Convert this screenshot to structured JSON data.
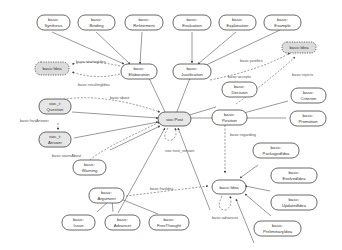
{
  "diagram": {
    "type": "ontology-graph",
    "nodes": {
      "synthesis": {
        "line1": "basic:",
        "line2": "Synthesis"
      },
      "binding": {
        "line1": "basic:",
        "line2": "Binding"
      },
      "refinement": {
        "line1": "basic:",
        "line2": "Refinement"
      },
      "evaluation": {
        "line1": "basic:",
        "line2": "Evaluation"
      },
      "explanation": {
        "line1": "basic:",
        "line2": "Explanation"
      },
      "example": {
        "line1": "basic:",
        "line2": "Example"
      },
      "idea_top_right": {
        "label": "basic:Idea"
      },
      "idea_left": {
        "label": "basic:Idea"
      },
      "elaboration": {
        "line1": "basic:",
        "line2": "Elaboration"
      },
      "justification": {
        "line1": "basic:",
        "line2": "Justification"
      },
      "decision": {
        "line1": "basic:",
        "line2": "Decision"
      },
      "question": {
        "line1": "sioc_t:",
        "line2": "Question"
      },
      "answer": {
        "line1": "sioc_t:",
        "line2": "Answer"
      },
      "post": {
        "label": "sioc:Post"
      },
      "position": {
        "line1": "basic:",
        "line2": "Position"
      },
      "criterion": {
        "line1": "basic:",
        "line2": "Criterion"
      },
      "promotion": {
        "line1": "basic:",
        "line2": "Promotion"
      },
      "packaged": {
        "line1": "basic:",
        "line2": "PackagedIdea"
      },
      "warning": {
        "line1": "basic:",
        "line2": "Warning"
      },
      "argument": {
        "line1": "basic:",
        "line2": "Argument"
      },
      "idea_bottom": {
        "label": "basic:Idea"
      },
      "evolved": {
        "line1": "basic:",
        "line2": "EvolvedIdea"
      },
      "updated": {
        "line1": "basic:",
        "line2": "UpdatedIdea"
      },
      "preliminary": {
        "line1": "basic:",
        "line2": "PreliminaryIdea"
      },
      "issue": {
        "line1": "basic:",
        "line2": "Issue"
      },
      "advancer": {
        "line1": "basic:",
        "line2": "Advancer"
      },
      "freethought": {
        "line1": "basic:",
        "line2": "FreeThought"
      }
    },
    "edge_labels": {
      "starting": "basic:startingIdea",
      "resulting": "basic:resultingIdea",
      "about": "basic:about",
      "hasanswer": "basic:hasAnswer",
      "startsabout": "basic:startsAbout",
      "justifies": "basic:justifies",
      "accepts": "basic:accepts",
      "rejects": "basic:rejects",
      "regarding": "basic:regarding",
      "nextversion": "sioc:next_version",
      "hasidea": "basic:hasIdea",
      "advances": "basic:advances"
    }
  }
}
